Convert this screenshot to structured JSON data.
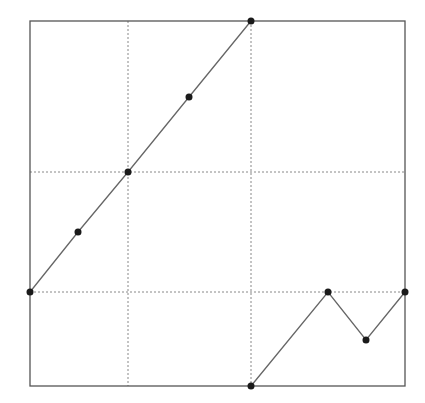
{
  "chart_data": {
    "type": "line",
    "title": "",
    "xlabel": "",
    "ylabel": "",
    "legend": [],
    "grid": true,
    "frame": {
      "left": 30,
      "top": 21,
      "right": 405,
      "bottom": 386
    },
    "grid_lines": {
      "vertical_px": [
        128,
        251
      ],
      "horizontal_px": [
        172,
        292
      ]
    },
    "series": [
      {
        "name": "rising-segment",
        "points_px": [
          [
            30,
            292
          ],
          [
            78,
            232
          ],
          [
            128,
            172
          ],
          [
            189,
            97
          ],
          [
            251,
            21
          ]
        ]
      },
      {
        "name": "zigzag-segment",
        "points_px": [
          [
            251,
            386
          ],
          [
            328,
            292
          ],
          [
            366,
            340
          ],
          [
            405,
            292
          ]
        ]
      }
    ],
    "colors": {
      "frame": "#555555",
      "grid": "#888888",
      "line": "#666666",
      "marker": "#1a1a1a"
    }
  }
}
